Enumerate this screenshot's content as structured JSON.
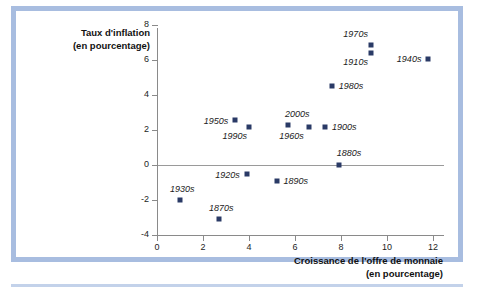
{
  "chart_data": {
    "type": "scatter",
    "title": "",
    "xlabel": "Croissance de l'offre de monnaie (en pourcentage)",
    "ylabel": "Taux d'inflation (en pourcentage)",
    "xlabel_line1": "Croissance de l'offre de monnaie",
    "xlabel_line2": "(en pourcentage)",
    "ylabel_line1": "Taux d'inflation",
    "ylabel_line2": "(en pourcentage)",
    "xlim": [
      0,
      12.5
    ],
    "ylim": [
      -4,
      8
    ],
    "xticks": [
      0,
      2,
      4,
      6,
      8,
      10,
      12
    ],
    "xtick_labels": [
      "0",
      "2",
      "4",
      "6",
      "8",
      "10",
      "12"
    ],
    "yticks": [
      -4,
      -2,
      0,
      2,
      4,
      6,
      8
    ],
    "ytick_labels": [
      "-4",
      "-2",
      "0",
      "2",
      "4",
      "6",
      "8"
    ],
    "grid": false,
    "legend": "none",
    "zero_line": true,
    "marker_color": "#2a3a66",
    "axis_color": "#8a8a8a",
    "points": [
      {
        "label": "1930s",
        "x": 1.0,
        "y": -2.0
      },
      {
        "label": "1870s",
        "x": 2.7,
        "y": -3.1
      },
      {
        "label": "1950s",
        "x": 3.4,
        "y": 2.6
      },
      {
        "label": "1920s",
        "x": 3.9,
        "y": -0.5
      },
      {
        "label": "1990s",
        "x": 4.0,
        "y": 2.2
      },
      {
        "label": "1890s",
        "x": 5.2,
        "y": -0.9
      },
      {
        "label": "2000s",
        "x": 5.7,
        "y": 2.3
      },
      {
        "label": "1960s",
        "x": 6.6,
        "y": 2.2
      },
      {
        "label": "1900s",
        "x": 7.3,
        "y": 2.2
      },
      {
        "label": "1980s",
        "x": 7.6,
        "y": 4.5
      },
      {
        "label": "1880s",
        "x": 7.9,
        "y": 0.0
      },
      {
        "label": "1910s",
        "x": 9.3,
        "y": 6.4
      },
      {
        "label": "1970s",
        "x": 9.3,
        "y": 6.9
      },
      {
        "label": "1940s",
        "x": 11.8,
        "y": 6.1
      }
    ]
  },
  "frame": {
    "border_color": "#a8bde0",
    "rule_color": "#c3d2ea",
    "background": "#ffffff"
  }
}
